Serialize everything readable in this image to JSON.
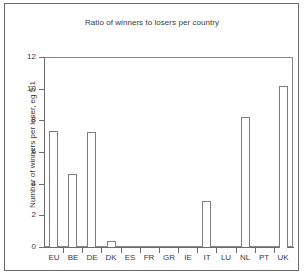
{
  "chart_data": {
    "type": "bar",
    "title": "Ratio of winners to losers per country",
    "xlabel": "",
    "ylabel": "Number of winners per loser, eg 5:1",
    "categories": [
      "EU",
      "BE",
      "DE",
      "DK",
      "ES",
      "FR",
      "GR",
      "IE",
      "IT",
      "LU",
      "NL",
      "PT",
      "UK"
    ],
    "values": [
      7.35,
      4.6,
      7.25,
      0.4,
      0,
      0,
      0,
      0,
      2.9,
      0,
      8.2,
      0,
      10.2
    ],
    "ylim": [
      0,
      12
    ],
    "ytick_labels": [
      "0",
      "2",
      "4",
      "6",
      "8",
      "10",
      "12"
    ],
    "ytick_values": [
      0,
      2,
      4,
      6,
      8,
      10,
      12
    ],
    "grid": false,
    "legend": "none",
    "bar_fill_color": "#ffffff",
    "bar_border_color": "#7d7d7d",
    "axis_color": "#6b6b6b",
    "text_color": "#3a3a3a",
    "background_color": "#ffffff"
  }
}
